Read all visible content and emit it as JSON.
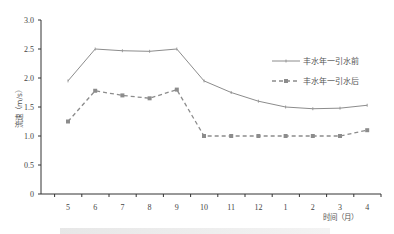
{
  "chart_data": {
    "type": "line",
    "title": "",
    "xlabel": "时间（月）",
    "ylabel": "流速（m/s）",
    "ylim": [
      0,
      3.0
    ],
    "yticks": [
      "0",
      "0.5",
      "1.0",
      "1.5",
      "2.0",
      "2.5",
      "3.0"
    ],
    "ytick_values": [
      0,
      0.5,
      1.0,
      1.5,
      2.0,
      2.5,
      3.0
    ],
    "categories": [
      "5",
      "6",
      "7",
      "8",
      "9",
      "10",
      "11",
      "12",
      "1",
      "2",
      "3",
      "4"
    ],
    "grid": false,
    "legend_position": "upper-right-inside",
    "series": [
      {
        "name": "丰水年一引水前",
        "style": "solid",
        "marker": "dash",
        "color": "#8c8c8c",
        "values": [
          1.95,
          2.5,
          2.47,
          2.46,
          2.5,
          1.95,
          1.75,
          1.6,
          1.5,
          1.47,
          1.48,
          1.53
        ]
      },
      {
        "name": "丰水年一引水后",
        "style": "dashed",
        "marker": "square",
        "color": "#8c8c8c",
        "values": [
          1.25,
          1.78,
          1.7,
          1.65,
          1.8,
          1.0,
          1.0,
          1.0,
          1.0,
          1.0,
          1.0,
          1.1
        ]
      }
    ]
  },
  "legend": {
    "items": [
      {
        "label": "丰水年一引水前"
      },
      {
        "label": "丰水年一引水后"
      }
    ]
  }
}
